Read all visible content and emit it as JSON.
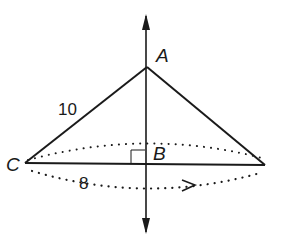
{
  "diagram": {
    "type": "geometry",
    "labels": {
      "vertex_a": "A",
      "vertex_b": "B",
      "vertex_c": "C",
      "hypotenuse_length": "10",
      "radius_length": "8"
    },
    "colors": {
      "line": "#1a1a1a",
      "background": "#ffffff"
    }
  }
}
